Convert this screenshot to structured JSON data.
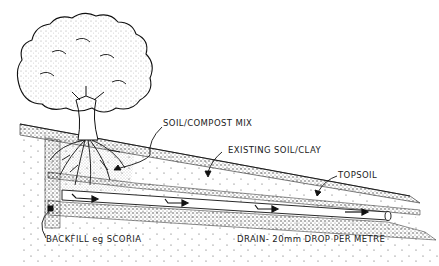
{
  "diagram": {
    "labels": {
      "soil_compost": "SOIL/COMPOST MIX",
      "existing_soil": "EXISTING SOIL/CLAY",
      "topsoil": "TOPSOIL",
      "backfill": "BACKFILL eg SCORIA",
      "drain": "DRAIN- 20mm DROP PER METRE"
    },
    "colors": {
      "ink": "#1a1a1a",
      "background": "#ffffff"
    }
  }
}
